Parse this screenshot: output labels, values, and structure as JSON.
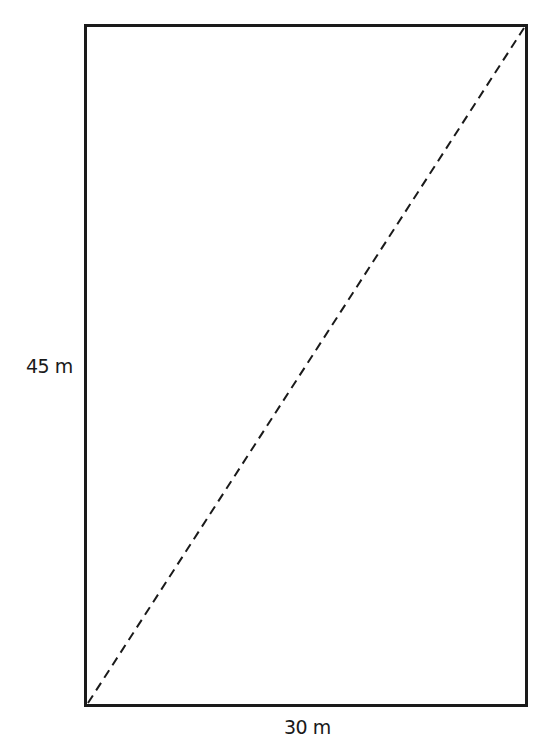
{
  "diagram": {
    "type": "rectangle-with-diagonal",
    "rectangle": {
      "width_label": "30 m",
      "height_label": "45 m"
    },
    "diagonal": {
      "style": "dashed",
      "from": "bottom-left",
      "to": "top-right"
    },
    "colors": {
      "stroke": "#1a1a1a",
      "background": "#ffffff"
    }
  }
}
